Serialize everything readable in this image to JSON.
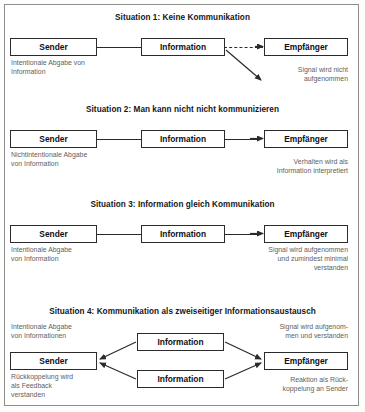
{
  "document": {
    "title": "Kommunikationssituationen – vier Modelle",
    "border_color": "#8d8d8d",
    "line_color": "#2b2b2b",
    "caption_color": "#5e5e5e",
    "background": "#ffffff"
  },
  "situations": [
    {
      "id": "situation-1",
      "title": "Situation 1: Keine Kommunikation",
      "nodes": {
        "sender": "Sender",
        "information": "Information",
        "empfaenger": "Empfänger"
      },
      "caption_left": "Intentionale Abgabe von\nInformation",
      "caption_right": "Signal wird nicht\naufgenommen",
      "connector_sender_information": "solid-line",
      "connector_information_empfaenger": "dashed-arrow",
      "extra_connector": "diagonal-arrow-down-right"
    },
    {
      "id": "situation-2",
      "title": "Situation 2: Man kann nicht nicht kommunizieren",
      "nodes": {
        "sender": "Sender",
        "information": "Information",
        "empfaenger": "Empfänger"
      },
      "caption_left": "Nichtintentionale Abgabe\nvon Information",
      "caption_right": "Verhalten wird als\nInformation interpretiert",
      "connector_sender_information": "solid-line",
      "connector_information_empfaenger": "solid-arrow"
    },
    {
      "id": "situation-3",
      "title": "Situation 3: Information gleich Kommunikation",
      "nodes": {
        "sender": "Sender",
        "information": "Information",
        "empfaenger": "Empfänger"
      },
      "caption_left": "Intentionale Abgabe\nvon Information",
      "caption_right": "Signal wird aufgenommen\nund zumindest minimal\nverstanden",
      "connector_sender_information": "solid-line",
      "connector_information_empfaenger": "solid-arrow"
    },
    {
      "id": "situation-4",
      "title": "Situation 4: Kommunikation als zweiseitiger Informationsaustausch",
      "nodes": {
        "sender": "Sender",
        "information_top": "Information",
        "information_bottom": "Information",
        "empfaenger": "Empfänger"
      },
      "caption_left_top": "Intentionale Abgabe\nvon Informationen",
      "caption_left_bottom": "Rückkoppelung wird\nals Feedback\nverstanden",
      "caption_right_top": "Signal wird aufgenom-\nmen und verstanden",
      "caption_right_bottom": "Reaktion als Rück-\nkoppelung an Sender",
      "connectors": "converging-arrows-both-sides"
    }
  ]
}
